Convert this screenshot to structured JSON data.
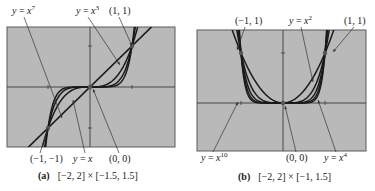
{
  "figure": {
    "background": "#ffffff",
    "screen_fill": "#b9b9b9",
    "screen_border": "#5a5a5a",
    "curve_color": "#1a1a1a",
    "axis_color": "#3a3a3a"
  },
  "chart_data": [
    {
      "type": "line",
      "panel": "(a)",
      "title": "[-2, 2] × [-1.5, 1.5]",
      "caption_letter": "(a)",
      "caption_window": "[−2, 2] × [−1.5, 1.5]",
      "xlim": [
        -2,
        2
      ],
      "ylim": [
        -1.5,
        1.5
      ],
      "grid": false,
      "ticks": {
        "x": [
          -1,
          1
        ],
        "y": [
          -1,
          1
        ]
      },
      "series": [
        {
          "name": "y = x",
          "exponent": 1
        },
        {
          "name": "y = x^3",
          "exponent": 3
        },
        {
          "name": "y = x^5",
          "exponent": 5
        },
        {
          "name": "y = x^7",
          "exponent": 7
        }
      ],
      "points": [
        {
          "label": "(1, 1)",
          "x": 1,
          "y": 1
        },
        {
          "label": "(0, 0)",
          "x": 0,
          "y": 0
        },
        {
          "label": "(−1, −1)",
          "x": -1,
          "y": -1
        }
      ],
      "annotations": [
        {
          "text_pre": "y = x",
          "sup": "7",
          "text_x": 12,
          "text_y": 14,
          "arrow_to": [
            62,
            118
          ]
        },
        {
          "text_pre": "y = x",
          "sup": "3",
          "text_x": 76,
          "text_y": 14,
          "arrow_to": [
            120,
            65
          ]
        },
        {
          "text_pre": "(1, 1)",
          "sup": "",
          "text_x": 109,
          "text_y": 14,
          "arrow_to": [
            132,
            46
          ]
        },
        {
          "text_pre": "(−1, −1)",
          "sup": "",
          "text_x": 30,
          "text_y": 162,
          "arrow_to": [
            48,
            128
          ]
        },
        {
          "text_pre": "y = x",
          "sup": "",
          "text_x": 73,
          "text_y": 162,
          "arrow_to": [
            73,
            100
          ]
        },
        {
          "text_pre": "(0, 0)",
          "sup": "",
          "text_x": 109,
          "text_y": 162,
          "arrow_to": [
            93,
            89
          ]
        }
      ]
    },
    {
      "type": "line",
      "panel": "(b)",
      "title": "[-2, 2] × [-1, 1.5]",
      "caption_letter": "(b)",
      "caption_window": "[−2, 2] × [−1, 1.5]",
      "xlim": [
        -2,
        2
      ],
      "ylim": [
        -1,
        1.5
      ],
      "grid": false,
      "ticks": {
        "x": [
          -1,
          1
        ],
        "y": [
          1
        ]
      },
      "series": [
        {
          "name": "y = x^2",
          "exponent": 2
        },
        {
          "name": "y = x^4",
          "exponent": 4
        },
        {
          "name": "y = x^6",
          "exponent": 6
        },
        {
          "name": "y = x^8",
          "exponent": 8
        },
        {
          "name": "y = x^10",
          "exponent": 10
        }
      ],
      "points": [
        {
          "label": "(−1, 1)",
          "x": -1,
          "y": 1
        },
        {
          "label": "(1, 1)",
          "x": 1,
          "y": 1
        },
        {
          "label": "(0, 0)",
          "x": 0,
          "y": 0
        }
      ],
      "annotations": [
        {
          "text_pre": "(−1, 1)",
          "sup": "",
          "text_x": 235,
          "text_y": 24,
          "arrow_to": [
            237,
            50
          ]
        },
        {
          "text_pre": "y = x",
          "sup": "2",
          "text_x": 289,
          "text_y": 24,
          "arrow_to": [
            313,
            82
          ]
        },
        {
          "text_pre": "(1, 1)",
          "sup": "",
          "text_x": 344,
          "text_y": 24,
          "arrow_to": [
            333,
            52
          ]
        },
        {
          "text_pre": "y = x",
          "sup": "10",
          "text_x": 201,
          "text_y": 161,
          "arrow_to": [
            238,
            102
          ]
        },
        {
          "text_pre": "(0, 0)",
          "sup": "",
          "text_x": 286,
          "text_y": 161,
          "arrow_to": [
            285,
            106
          ]
        },
        {
          "text_pre": "y = x",
          "sup": "4",
          "text_x": 324,
          "text_y": 161,
          "arrow_to": [
            318,
            100
          ]
        }
      ]
    }
  ],
  "panels": [
    {
      "box": [
        7,
        27,
        168,
        120
      ],
      "origin": [
        90,
        87
      ],
      "unit": [
        42,
        41
      ]
    },
    {
      "box": [
        197,
        30,
        169,
        121
      ],
      "origin": [
        283,
        103
      ],
      "unit": [
        42,
        50
      ]
    }
  ],
  "captions": [
    {
      "letter": "(a)",
      "window": "[−2, 2] × [−1.5, 1.5]",
      "x": 38,
      "y": 179
    },
    {
      "letter": "(b)",
      "window": "[−2, 2] × [−1, 1.5]",
      "x": 238,
      "y": 180
    }
  ]
}
